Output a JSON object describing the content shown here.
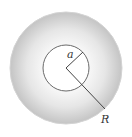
{
  "diagram": {
    "title": "",
    "outer_circle": {
      "label": "R",
      "cx": 66,
      "cy": 68,
      "r": 56,
      "fill_inner": "#fafafa",
      "fill_outer": "#c8c8c8",
      "stroke": "#d8d8d8"
    },
    "inner_circle": {
      "label": "a",
      "cx": 66,
      "cy": 68,
      "r": 23,
      "fill": "#ffffff",
      "stroke": "#666666"
    },
    "labels": {
      "inner_radius": "a",
      "outer_radius": "R"
    },
    "colors": {
      "line": "#444444",
      "background": "#ffffff"
    }
  }
}
